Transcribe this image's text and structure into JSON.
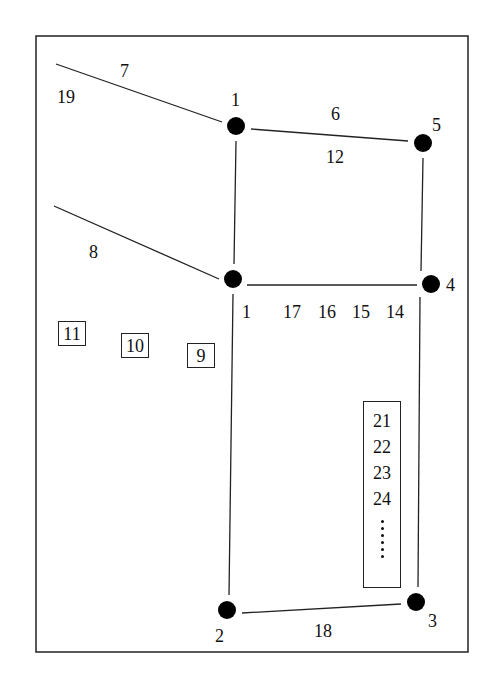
{
  "diagram": {
    "type": "network-topology",
    "frame": {
      "x": 36,
      "y": 36,
      "w": 432,
      "h": 616,
      "stroke": "#222222"
    },
    "nodes": [
      {
        "id": "1",
        "label": "1",
        "x": 236,
        "y": 126
      },
      {
        "id": "5",
        "label": "5",
        "x": 423,
        "y": 143
      },
      {
        "id": "A",
        "label": "",
        "x": 233,
        "y": 279
      },
      {
        "id": "4",
        "label": "4",
        "x": 431,
        "y": 284
      },
      {
        "id": "2",
        "label": "2",
        "x": 227,
        "y": 610
      },
      {
        "id": "3",
        "label": "3",
        "x": 416,
        "y": 602
      }
    ],
    "edges": [
      {
        "from": [
          56,
          64
        ],
        "to": [
          222,
          122
        ],
        "label": "7"
      },
      {
        "from": [
          251,
          129
        ],
        "to": [
          408,
          141
        ],
        "label": "6 / 12"
      },
      {
        "from": [
          236,
          141
        ],
        "to": [
          234,
          264
        ],
        "label": ""
      },
      {
        "from": [
          423,
          158
        ],
        "to": [
          421,
          271
        ],
        "label": ""
      },
      {
        "from": [
          54,
          206
        ],
        "to": [
          219,
          279
        ],
        "label": "8"
      },
      {
        "from": [
          247,
          285
        ],
        "to": [
          417,
          285
        ],
        "label": "17 16 15 14"
      },
      {
        "from": [
          233,
          294
        ],
        "to": [
          229,
          595
        ],
        "label": "1"
      },
      {
        "from": [
          420,
          297
        ],
        "to": [
          418,
          587
        ],
        "label": ""
      },
      {
        "from": [
          242,
          613
        ],
        "to": [
          401,
          604
        ],
        "label": "18"
      }
    ],
    "labels": {
      "node_1": "1",
      "node_5": "5",
      "node_4": "4",
      "node_2": "2",
      "node_3": "3",
      "edge_7": "7",
      "edge_19": "19",
      "edge_6": "6",
      "edge_12": "12",
      "edge_8": "8",
      "edge_1": "1",
      "edge_17": "17",
      "edge_16": "16",
      "edge_15": "15",
      "edge_14": "14",
      "edge_18": "18"
    },
    "boxed_labels": [
      "11",
      "10",
      "9"
    ],
    "stack_labels": [
      "21",
      "22",
      "23",
      "24"
    ],
    "stack_continuation": "......"
  }
}
